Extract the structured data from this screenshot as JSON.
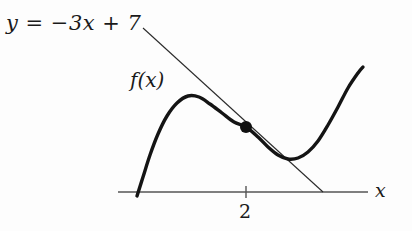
{
  "figure": {
    "title": "",
    "background_color": "#fdfdfd",
    "ink_color": "#1a1a1a",
    "axis_color": "#555555"
  },
  "labels": {
    "line_equation": "y = −3x + 7",
    "function_label": "f(x)",
    "x_axis_label": "x",
    "tick_label_2": "2"
  },
  "chart_data": {
    "type": "line",
    "title": "",
    "xlabel": "x",
    "ylabel": "",
    "grid": false,
    "legend": "none",
    "annotations": [
      {
        "name": "tangent-line-equation",
        "text": "y = −3x + 7",
        "describes": "tangent-line"
      },
      {
        "name": "curve-label",
        "text": "f(x)",
        "describes": "function-curve"
      },
      {
        "name": "tangency-point-marker",
        "text": "",
        "x": 2,
        "describes": "filled dot where the line touches the curve"
      }
    ],
    "xticks": [
      2
    ],
    "xticklabels": [
      "2"
    ],
    "yticks": [],
    "yticklabels": [],
    "series": [
      {
        "name": "f(x)",
        "type": "curve",
        "style": "thick-solid",
        "description": "cubic-like curve rising from the x-axis to a local maximum, falling through the tangency point at x = 2 to a local minimum, then rising steeply",
        "points_px": [
          [
            137,
            196
          ],
          [
            143,
            177
          ],
          [
            150,
            155
          ],
          [
            158,
            134
          ],
          [
            167,
            116
          ],
          [
            177,
            103
          ],
          [
            188,
            96
          ],
          [
            199,
            97
          ],
          [
            210,
            104
          ],
          [
            222,
            113
          ],
          [
            234,
            122
          ],
          [
            246,
            127
          ],
          [
            258,
            137
          ],
          [
            268,
            147
          ],
          [
            278,
            155
          ],
          [
            288,
            159
          ],
          [
            298,
            158
          ],
          [
            308,
            152
          ],
          [
            318,
            141
          ],
          [
            328,
            125
          ],
          [
            338,
            107
          ],
          [
            348,
            88
          ],
          [
            358,
            73
          ],
          [
            363,
            67
          ]
        ]
      },
      {
        "name": "y = -3x + 7",
        "type": "line",
        "style": "thin-solid",
        "slope": -3,
        "intercept": 7,
        "points_px": [
          [
            143,
            28
          ],
          [
            323,
            192
          ]
        ]
      }
    ],
    "markers": [
      {
        "name": "tangency-point",
        "x": 2,
        "px": [
          246,
          127
        ],
        "shape": "filled-circle",
        "radius_px": 6
      }
    ],
    "axes": {
      "x_axis_px": {
        "x1": 118,
        "y1": 192,
        "x2": 368,
        "y2": 192
      },
      "tick_px": {
        "x": 246,
        "y_top": 186,
        "y_bottom": 198
      },
      "y_axis_visible": false
    }
  }
}
